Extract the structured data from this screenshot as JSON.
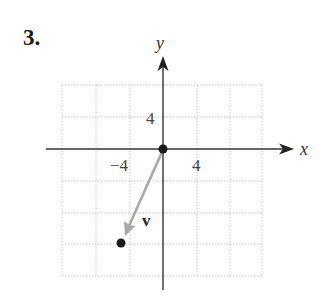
{
  "problem": {
    "number_label": "3."
  },
  "diagram": {
    "type": "vector-on-coordinate-grid",
    "axes": {
      "x_label": "x",
      "y_label": "y",
      "x_tick_labels": [
        "−4",
        "4"
      ],
      "y_tick_labels": [
        "4"
      ],
      "units_per_grid_cell": 4,
      "grid_x_range": [
        -12,
        12
      ],
      "grid_y_range": [
        -16,
        8
      ]
    },
    "vector": {
      "label": "v",
      "initial_point": [
        0,
        0
      ],
      "terminal_point": [
        -5,
        -12
      ],
      "components": "⟨−5, −12⟩"
    },
    "points": [
      {
        "name": "origin",
        "coords": [
          0,
          0
        ]
      },
      {
        "name": "terminal",
        "coords": [
          -5,
          -12
        ]
      }
    ],
    "colors": {
      "axis": "#333333",
      "grid": "#c8c8c8",
      "vector": "#a8a8a8",
      "point": "#1a1a1a",
      "text": "#333333"
    }
  }
}
